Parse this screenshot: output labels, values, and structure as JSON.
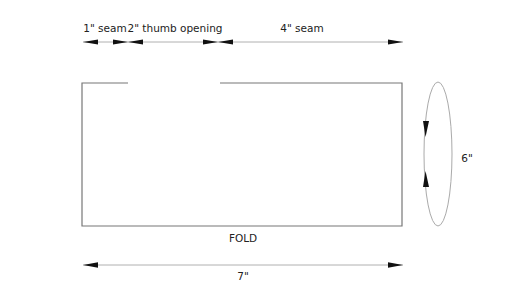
{
  "diagram": {
    "type": "sewing-pattern",
    "colors": {
      "background": "#ffffff",
      "outline": "#777777",
      "dimension_line": "#aaaaaa",
      "arrowhead": "#111111",
      "text": "#222222"
    },
    "top_dimensions": [
      {
        "label": "1\" seam",
        "from_x": 83,
        "to_x": 128
      },
      {
        "label": "2\" thumb opening",
        "from_x": 128,
        "to_x": 218
      },
      {
        "label": "4\" seam",
        "from_x": 218,
        "to_x": 403
      }
    ],
    "pattern_piece": {
      "shape": "rectangle",
      "top_edge_gap": {
        "start_x": 128,
        "end_x": 220,
        "meaning": "2\" thumb opening"
      },
      "bottom_label": "FOLD"
    },
    "width_dimension": {
      "label": "7\""
    },
    "height_dimension": {
      "label": "6\"",
      "style": "ellipse-loop-arrows"
    }
  }
}
